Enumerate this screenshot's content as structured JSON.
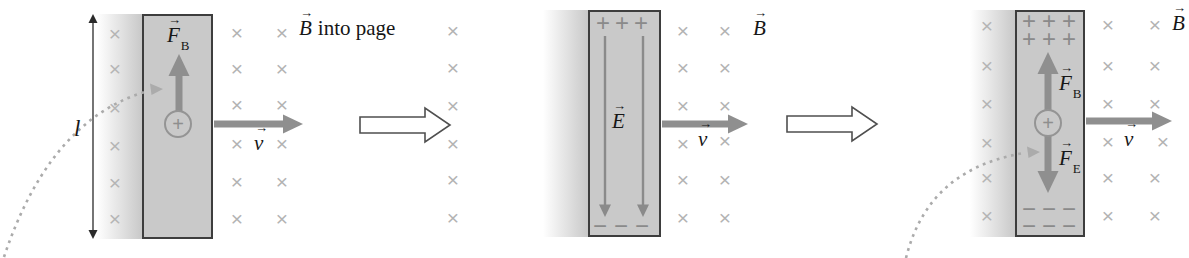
{
  "symbols": {
    "mark": "×",
    "plus": "+",
    "minus": "−",
    "vec": "→"
  },
  "panels": [
    {
      "length_label": "l",
      "force_letter": "F",
      "force_sub": "B",
      "charge_sign": "+",
      "velocity_letter": "v",
      "field_letter": "B",
      "field_note": "into page"
    },
    {
      "efield_letter": "E",
      "velocity_letter": "v",
      "field_letter": "B"
    },
    {
      "force_letter": "F",
      "force_b_sub": "B",
      "force_e_sub": "E",
      "charge_sign": "+",
      "velocity_letter": "v",
      "field_letter": "B"
    }
  ]
}
